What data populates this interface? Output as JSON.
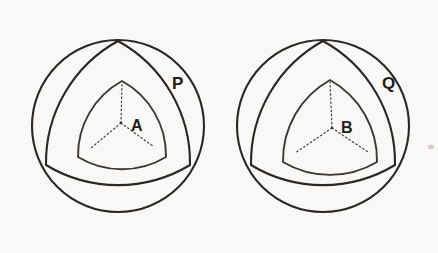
{
  "figure": {
    "background_color": "#f9f8f6",
    "ink_color": "#2a2724",
    "dotted_line_color": "#4a4642"
  },
  "panels": [
    {
      "id": "left",
      "outer_label": "P",
      "inner_label": "A",
      "circle": {
        "cx": 118,
        "cy": 126,
        "r": 86
      },
      "outer_reuleaux": {
        "cx": 118,
        "cy": 126,
        "r": 84,
        "rotation": -90
      },
      "middle_reuleaux": {
        "cx": 118,
        "cy": 121,
        "r": 70,
        "rotation": -90
      },
      "inner_reuleaux": {
        "cx": 122,
        "cy": 122,
        "r": 43,
        "rotation": -90
      },
      "outer_label_pos": {
        "x": 172,
        "y": 89
      },
      "inner_label_pos": {
        "x": 131,
        "y": 131
      },
      "center_dot": {
        "x": 121,
        "y": 123
      },
      "radii_count": 3
    },
    {
      "id": "right",
      "outer_label": "Q",
      "inner_label": "B",
      "circle": {
        "cx": 323,
        "cy": 126,
        "r": 86
      },
      "outer_reuleaux": {
        "cx": 323,
        "cy": 126,
        "r": 84,
        "rotation": -90
      },
      "middle_reuleaux": {
        "cx": 323,
        "cy": 121,
        "r": 70,
        "rotation": -90
      },
      "inner_reuleaux": {
        "cx": 330,
        "cy": 124,
        "r": 46,
        "rotation": -90
      },
      "outer_label_pos": {
        "x": 382,
        "y": 89
      },
      "inner_label_pos": {
        "x": 341,
        "y": 133
      },
      "center_dot": {
        "x": 332,
        "y": 128
      },
      "radii_count": 3
    }
  ],
  "artifacts": [
    {
      "name": "scan-speck",
      "x": 430,
      "y": 146,
      "w": 4,
      "h": 3
    }
  ]
}
